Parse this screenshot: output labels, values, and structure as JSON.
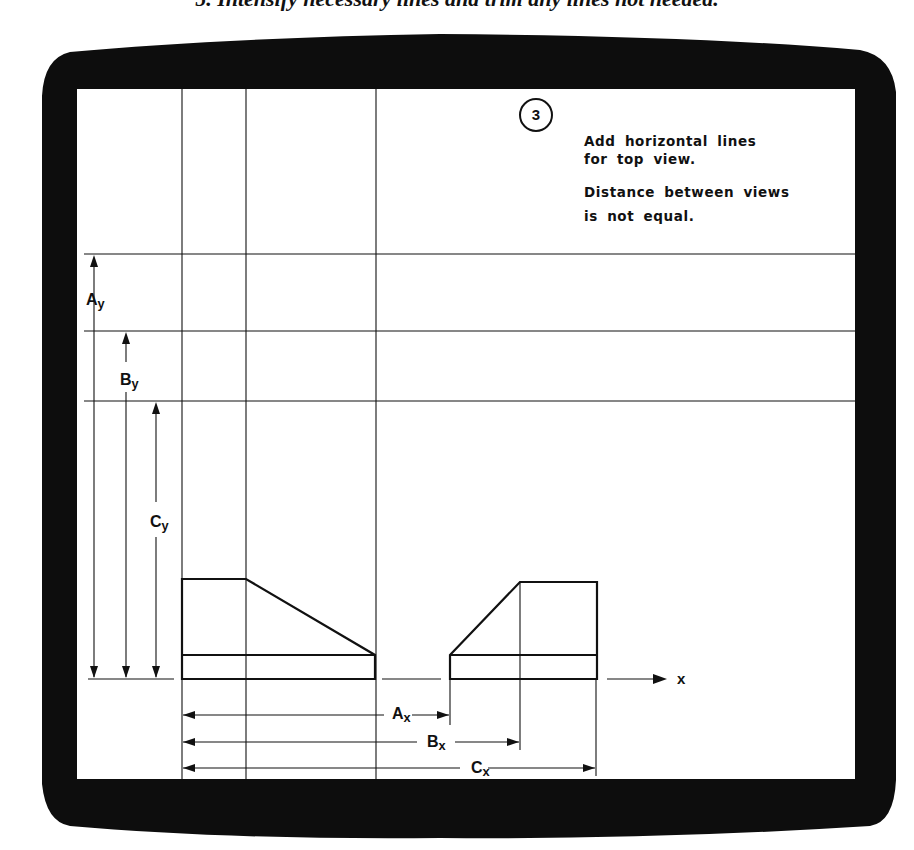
{
  "caption": "5. Intensify necessary lines and trim any lines not needed.",
  "step": {
    "number": "3",
    "instructions": [
      "Add horizontal lines",
      "for top view.",
      "Distance between views",
      "is not equal."
    ]
  },
  "labels": {
    "Ay": {
      "main": "A",
      "sub": "y"
    },
    "By": {
      "main": "B",
      "sub": "y"
    },
    "Cy": {
      "main": "C",
      "sub": "y"
    },
    "Ax": {
      "main": "A",
      "sub": "x"
    },
    "Bx": {
      "main": "B",
      "sub": "x"
    },
    "Cx": {
      "main": "C",
      "sub": "x"
    },
    "axis": "x"
  },
  "colors": {
    "bezel": "#0d0d0d",
    "screen": "#ffffff",
    "ink": "#111111"
  }
}
